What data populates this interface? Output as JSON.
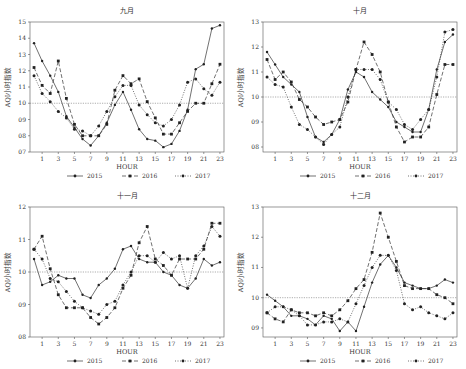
{
  "figure": {
    "legend": [
      "2015",
      "2016",
      "2017"
    ],
    "xlabel": "HOUR",
    "ylabel": "AQI小时指数",
    "reference_line": 1.0
  },
  "chart_data": [
    {
      "type": "line",
      "title": "九月",
      "xlabel": "HOUR",
      "ylabel": "AQI小时指数",
      "x": [
        0,
        1,
        2,
        3,
        4,
        5,
        6,
        7,
        8,
        9,
        10,
        11,
        12,
        13,
        14,
        15,
        16,
        17,
        18,
        19,
        20,
        21,
        22,
        23
      ],
      "xticks": [
        1,
        3,
        5,
        7,
        9,
        11,
        13,
        15,
        17,
        19,
        21,
        23
      ],
      "ylim": [
        0.7,
        1.5
      ],
      "yticks": [
        0.7,
        0.8,
        0.9,
        1.0,
        1.1,
        1.2,
        1.3,
        1.4,
        1.5
      ],
      "ytick_labels": [
        "07",
        "08",
        "09",
        "10",
        "11",
        "12",
        "13",
        "14",
        "15"
      ],
      "reference_line": 1.0,
      "legend_position": "bottom",
      "series": [
        {
          "name": "2015",
          "style": "solid",
          "values": [
            1.37,
            1.26,
            1.17,
            1.07,
            0.92,
            0.85,
            0.78,
            0.74,
            0.8,
            0.88,
            0.99,
            1.07,
            0.96,
            0.84,
            0.78,
            0.77,
            0.73,
            0.75,
            0.83,
            0.96,
            1.21,
            1.24,
            1.46,
            1.48
          ]
        },
        {
          "name": "2016",
          "style": "dashed",
          "values": [
            1.22,
            1.11,
            1.06,
            1.26,
            1.03,
            0.87,
            0.8,
            0.8,
            0.8,
            0.87,
            1.08,
            1.17,
            1.12,
            1.15,
            1.01,
            0.91,
            0.81,
            0.81,
            0.88,
            0.95,
            1.0,
            1.0,
            1.12,
            1.24
          ]
        },
        {
          "name": "2017",
          "style": "dotted",
          "values": [
            1.17,
            1.06,
            1.01,
            0.95,
            0.91,
            0.84,
            0.83,
            0.8,
            0.86,
            0.95,
            1.04,
            1.11,
            1.11,
            0.99,
            0.93,
            0.88,
            0.86,
            0.9,
            0.99,
            1.13,
            1.15,
            1.09,
            1.05,
            1.13
          ]
        }
      ]
    },
    {
      "type": "line",
      "title": "十月",
      "xlabel": "HOUR",
      "ylabel": "AQI小时指数",
      "x": [
        0,
        1,
        2,
        3,
        4,
        5,
        6,
        7,
        8,
        9,
        10,
        11,
        12,
        13,
        14,
        15,
        16,
        17,
        18,
        19,
        20,
        21,
        22,
        23
      ],
      "xticks": [
        1,
        3,
        5,
        7,
        9,
        11,
        13,
        15,
        17,
        19,
        21,
        23
      ],
      "ylim": [
        0.78,
        1.3
      ],
      "yticks": [
        0.8,
        0.9,
        1.0,
        1.1,
        1.2,
        1.3
      ],
      "ytick_labels": [
        "08",
        "09",
        "10",
        "11",
        "12",
        "13"
      ],
      "reference_line": 1.0,
      "legend_position": "bottom",
      "series": [
        {
          "name": "2015",
          "style": "solid",
          "values": [
            1.18,
            1.13,
            1.08,
            1.05,
            1.02,
            0.92,
            0.84,
            0.82,
            0.85,
            0.91,
            1.03,
            1.1,
            1.08,
            1.02,
            0.99,
            0.96,
            0.9,
            0.88,
            0.86,
            0.86,
            0.95,
            1.11,
            1.22,
            1.25
          ]
        },
        {
          "name": "2016",
          "style": "dashed",
          "values": [
            1.15,
            1.07,
            1.1,
            1.06,
            0.99,
            0.96,
            0.92,
            0.89,
            0.9,
            0.91,
            0.98,
            1.11,
            1.22,
            1.17,
            1.1,
            0.98,
            0.88,
            0.82,
            0.84,
            0.84,
            0.88,
            1.01,
            1.13,
            1.13
          ]
        },
        {
          "name": "2017",
          "style": "dotted",
          "values": [
            1.08,
            1.05,
            1.04,
            0.96,
            0.89,
            0.87,
            0.84,
            0.81,
            0.85,
            0.88,
            1.0,
            1.11,
            1.11,
            1.11,
            1.07,
            0.98,
            0.95,
            0.89,
            0.87,
            0.91,
            0.95,
            1.08,
            1.26,
            1.27
          ]
        }
      ]
    },
    {
      "type": "line",
      "title": "十一月",
      "xlabel": "HOUR",
      "ylabel": "AQI小时指数",
      "x": [
        0,
        1,
        2,
        3,
        4,
        5,
        6,
        7,
        8,
        9,
        10,
        11,
        12,
        13,
        14,
        15,
        16,
        17,
        18,
        19,
        20,
        21,
        22,
        23
      ],
      "xticks": [
        1,
        3,
        5,
        7,
        9,
        11,
        13,
        15,
        17,
        19,
        21,
        23
      ],
      "ylim": [
        0.8,
        1.2
      ],
      "yticks": [
        0.8,
        0.9,
        1.0,
        1.1,
        1.2
      ],
      "ytick_labels": [
        "08",
        "09",
        "10",
        "11",
        "12"
      ],
      "reference_line": 1.0,
      "legend_position": "bottom",
      "series": [
        {
          "name": "2015",
          "style": "solid",
          "values": [
            1.04,
            0.96,
            0.97,
            0.99,
            0.98,
            0.98,
            0.93,
            0.92,
            0.96,
            0.98,
            1.01,
            1.07,
            1.08,
            1.04,
            1.03,
            1.03,
            1.0,
            0.99,
            0.96,
            0.95,
            0.98,
            1.04,
            1.02,
            1.03
          ]
        },
        {
          "name": "2016",
          "style": "dashed",
          "values": [
            1.07,
            1.11,
            1.01,
            0.93,
            0.89,
            0.89,
            0.89,
            0.86,
            0.84,
            0.86,
            0.89,
            0.95,
            0.99,
            1.09,
            1.14,
            1.04,
            1.02,
            0.99,
            1.04,
            1.04,
            1.04,
            1.07,
            1.15,
            1.15
          ]
        },
        {
          "name": "2017",
          "style": "dotted",
          "values": [
            1.07,
            1.04,
            0.98,
            0.97,
            0.94,
            0.91,
            0.89,
            0.88,
            0.87,
            0.9,
            0.91,
            0.96,
            1.0,
            1.05,
            1.05,
            1.03,
            1.06,
            1.04,
            1.05,
            0.95,
            1.05,
            1.08,
            1.14,
            1.11
          ]
        }
      ]
    },
    {
      "type": "line",
      "title": "十二月",
      "xlabel": "HOUR",
      "ylabel": "AQI小时指数",
      "x": [
        0,
        1,
        2,
        3,
        4,
        5,
        6,
        7,
        8,
        9,
        10,
        11,
        12,
        13,
        14,
        15,
        16,
        17,
        18,
        19,
        20,
        21,
        22,
        23
      ],
      "xticks": [
        1,
        3,
        5,
        7,
        9,
        11,
        13,
        15,
        17,
        19,
        21,
        23
      ],
      "ylim": [
        0.87,
        1.3
      ],
      "yticks": [
        0.9,
        1.0,
        1.1,
        1.2,
        1.3
      ],
      "ytick_labels": [
        "09",
        "10",
        "11",
        "12",
        "13"
      ],
      "reference_line": 1.0,
      "legend_position": "bottom",
      "series": [
        {
          "name": "2015",
          "style": "solid",
          "values": [
            1.01,
            0.99,
            0.97,
            0.94,
            0.94,
            0.93,
            0.91,
            0.94,
            0.93,
            0.89,
            0.92,
            0.89,
            0.97,
            1.05,
            1.11,
            1.14,
            1.1,
            1.05,
            1.04,
            1.03,
            1.03,
            1.04,
            1.06,
            1.05
          ]
        },
        {
          "name": "2016",
          "style": "dashed",
          "values": [
            0.95,
            0.93,
            0.92,
            0.96,
            0.95,
            0.95,
            0.94,
            0.95,
            0.94,
            0.96,
            0.99,
            1.03,
            1.06,
            1.15,
            1.28,
            1.2,
            1.12,
            1.04,
            1.03,
            1.03,
            1.03,
            1.01,
            1.0,
            0.98
          ]
        },
        {
          "name": "2017",
          "style": "dotted",
          "values": [
            0.95,
            0.97,
            0.97,
            0.96,
            0.94,
            0.91,
            0.91,
            0.92,
            0.92,
            0.93,
            0.92,
            0.98,
            1.04,
            1.1,
            1.14,
            1.14,
            1.09,
            0.98,
            0.96,
            0.97,
            0.95,
            0.94,
            0.93,
            0.95
          ]
        }
      ]
    }
  ]
}
